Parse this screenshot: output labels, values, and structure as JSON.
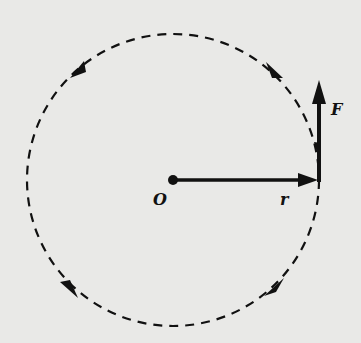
{
  "diagram": {
    "type": "circular-motion-vector-diagram",
    "center_label": "O",
    "radius_vector_label": "r",
    "force_vector_label": "F",
    "path_style": "dashed-circle",
    "direction": "counterclockwise",
    "colors": {
      "background": "#e9e9e7",
      "ink": "#111111"
    }
  }
}
